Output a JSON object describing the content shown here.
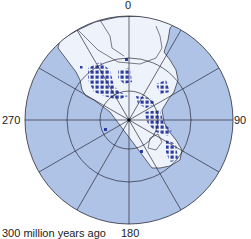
{
  "map": {
    "projection": "south polar stereographic",
    "caption": "300 million years ago",
    "longitude_labels": {
      "top": "0",
      "right": "90",
      "bottom": "180",
      "left": "270"
    },
    "graticule": {
      "radial_spacing_degrees": 30,
      "latitude_rings": 3
    },
    "colors": {
      "ocean": "#aec3e6",
      "land": "#eef3fb",
      "points": "#2d3ba3",
      "grid": "#2a2a3a"
    },
    "legend": {
      "points": "fossil/occurrence locations (dark blue squares)"
    }
  }
}
